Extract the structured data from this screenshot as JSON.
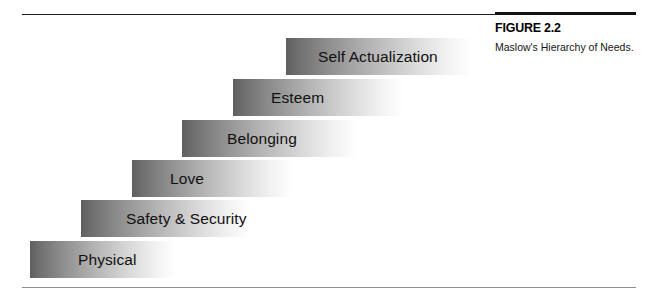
{
  "figure": {
    "number_label": "FIGURE 2.2",
    "caption": "Maslow's Hierarchy of Needs."
  },
  "diagram": {
    "type": "staircase",
    "title": "Maslow's Hierarchy of Needs",
    "orientation": "ascending-left-to-right",
    "step_count": 6,
    "gradient_start_color": "#5f5f5f",
    "gradient_end_color": "#ffffff",
    "rule_color_top": "#1b1b1b",
    "rule_color_bottom": "#8e8e8e",
    "steps": [
      {
        "level": 1,
        "label": "Physical",
        "left": 30,
        "top": 241,
        "width": 145,
        "text_left": 48
      },
      {
        "level": 2,
        "label": "Safety & Security",
        "left": 81,
        "top": 200,
        "width": 170,
        "text_left": 45
      },
      {
        "level": 3,
        "label": "Love",
        "left": 132,
        "top": 160,
        "width": 160,
        "text_left": 38
      },
      {
        "level": 4,
        "label": "Belonging",
        "left": 182,
        "top": 120,
        "width": 175,
        "text_left": 45
      },
      {
        "level": 5,
        "label": "Esteem",
        "left": 233,
        "top": 79,
        "width": 170,
        "text_left": 38
      },
      {
        "level": 6,
        "label": "Self Actualization",
        "left": 286,
        "top": 38,
        "width": 185,
        "text_left": 32
      }
    ]
  }
}
